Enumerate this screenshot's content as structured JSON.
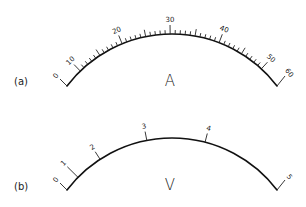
{
  "figure": {
    "background": "#ffffff",
    "ink_color": "#111111"
  },
  "meters": [
    {
      "id": "a",
      "panel_label": "(a)",
      "unit_label": "A",
      "meter_type": "ammeter",
      "center": [
        172,
        166
      ],
      "radius": 132,
      "start_angle": -52.7,
      "end_angle": 52.7,
      "panel_label_pos": [
        14,
        85
      ],
      "unit_label_pos": [
        170,
        86
      ],
      "end_hooks": {
        "left_end": [
          60,
          79
        ],
        "right_end": [
          285,
          76
        ]
      },
      "ticks_extend_min": 0,
      "major_ticks": [
        {
          "label": "0",
          "angle": -52.7,
          "hook": true
        },
        {
          "label": "10",
          "angle": -44.0
        },
        {
          "label": "20",
          "angle": -22.2
        },
        {
          "label": "30",
          "angle": -0.8
        },
        {
          "label": "40",
          "angle": 20.9
        },
        {
          "label": "50",
          "angle": 42.6
        },
        {
          "label": "60",
          "angle": 52.7,
          "hook": true
        }
      ],
      "minor_ticks": {
        "from": 10,
        "to": 50,
        "step": 1,
        "medium_every": 5
      }
    },
    {
      "id": "b",
      "panel_label": "(b)",
      "unit_label": "V",
      "meter_type": "voltmeter",
      "center": [
        172,
        270
      ],
      "radius": 132,
      "start_angle": -52.7,
      "end_angle": 52.7,
      "panel_label_pos": [
        14,
        190
      ],
      "unit_label_pos": [
        170,
        190
      ],
      "end_hooks": {
        "left_end": [
          60,
          183
        ],
        "right_end": [
          285,
          180
        ]
      },
      "major_ticks": [
        {
          "label": "0",
          "angle": -52.7,
          "hook": true
        },
        {
          "label": "1",
          "angle": -45.4,
          "extended": true
        },
        {
          "label": "2",
          "angle": -33.0
        },
        {
          "label": "3",
          "angle": -11.0
        },
        {
          "label": "4",
          "angle": 14.5
        },
        {
          "label": "5",
          "angle": 52.7,
          "hook": true
        }
      ]
    }
  ]
}
